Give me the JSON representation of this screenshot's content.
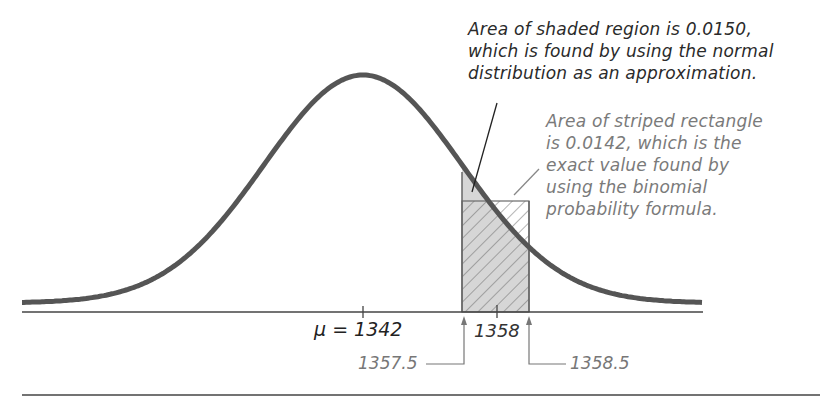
{
  "annotations": {
    "normal": {
      "lines": [
        "Area of shaded region is 0.0150,",
        "which is found by using the normal",
        "distribution as an approximation."
      ]
    },
    "binomial": {
      "lines": [
        "Area of striped rectangle",
        "is 0.0142, which is the",
        "exact value found by",
        "using the binomial",
        "probability formula."
      ]
    }
  },
  "axis": {
    "mean_label": "μ = 1342",
    "center_label": "1358",
    "lower_bound_label": "1357.5",
    "upper_bound_label": "1358.5"
  },
  "values": {
    "mean": 1342,
    "x": 1358,
    "lower": 1357.5,
    "upper": 1358.5,
    "normal_area": 0.015,
    "binomial_area": 0.0142
  },
  "colors": {
    "curve": "#555555",
    "shade": "#d6d6d6",
    "hatch": "#6a6a6a",
    "axis": "#444444",
    "annotation_dark": "#2a2a2a",
    "annotation_gray": "#7a7a7a"
  }
}
